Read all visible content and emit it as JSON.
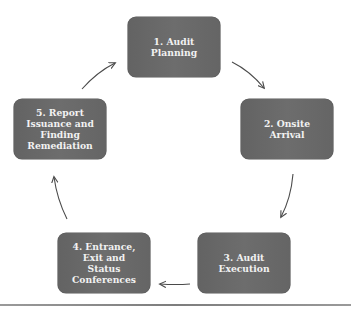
{
  "diagram": {
    "type": "cycle",
    "colors": {
      "box_fill": "#676767",
      "box_text": "#f2f2f2",
      "arrow": "#4a4a4a",
      "rule": "#8a8a8a"
    },
    "steps": [
      {
        "label": "1. Audit Planning"
      },
      {
        "label": "2. Onsite Arrival"
      },
      {
        "label": "3. Audit Execution"
      },
      {
        "label": "4. Entrance, Exit and Status Conferences"
      },
      {
        "label": "5. Report Issuance and Finding Remediation"
      }
    ],
    "edges": [
      {
        "from": 1,
        "to": 2
      },
      {
        "from": 2,
        "to": 3
      },
      {
        "from": 3,
        "to": 4
      },
      {
        "from": 4,
        "to": 5
      },
      {
        "from": 5,
        "to": 1
      }
    ]
  }
}
